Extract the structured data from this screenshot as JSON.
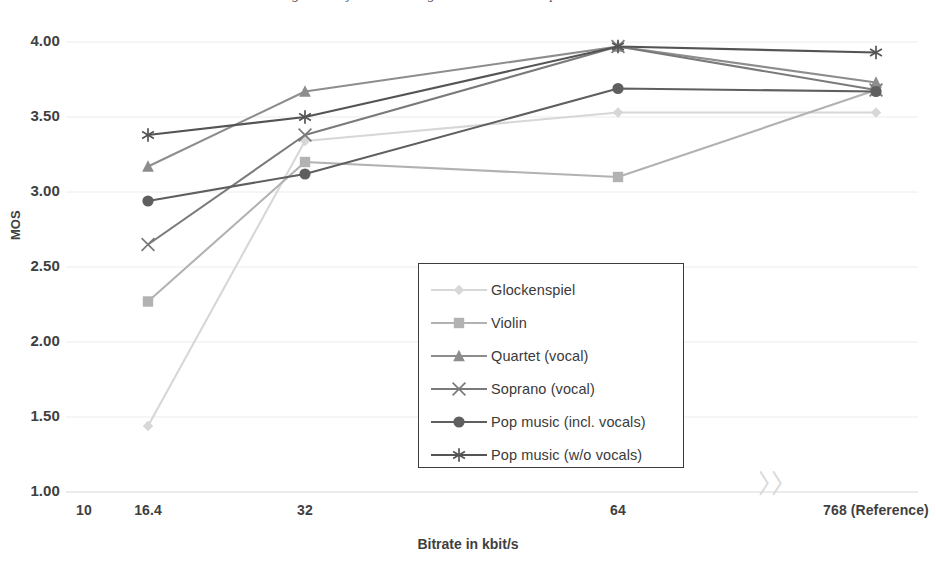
{
  "caption_clipped": "Figure: Subjective listening test results — MOS per item vs. bitrate",
  "axes": {
    "y_title": "MOS",
    "x_title": "Bitrate in kbit/s",
    "y_ticks": [
      "4.00",
      "3.50",
      "3.00",
      "2.50",
      "2.00",
      "1.50",
      "1.00"
    ],
    "x_ticks": [
      "10",
      "16.4",
      "32",
      "64",
      "768 (Reference)"
    ],
    "axis_break_symbol": "≈"
  },
  "legend": {
    "position": "center",
    "entries": [
      {
        "label": "Glockenspiel",
        "marker": "diamond-marker",
        "color": "#d7d7d7"
      },
      {
        "label": "Violin",
        "marker": "square-marker",
        "color": "#b2b2b2"
      },
      {
        "label": "Quartet (vocal)",
        "marker": "triangle-marker",
        "color": "#8d8d8d"
      },
      {
        "label": "Soprano (vocal)",
        "marker": "cross-marker",
        "color": "#7a7a7a"
      },
      {
        "label": "Pop music (incl. vocals)",
        "marker": "circle-marker",
        "color": "#5f5f5f"
      },
      {
        "label": "Pop music (w/o vocals)",
        "marker": "asterisk-marker",
        "color": "#545454"
      }
    ]
  },
  "chart_data": {
    "type": "line",
    "title": "",
    "xlabel": "Bitrate in kbit/s",
    "ylabel": "MOS",
    "categories": [
      "16.4",
      "32",
      "64",
      "768 (Reference)"
    ],
    "x_tick_labels": [
      "10",
      "16.4",
      "32",
      "64",
      "768 (Reference)"
    ],
    "ylim": [
      1.0,
      4.0
    ],
    "ytick_values": [
      1.0,
      1.5,
      2.0,
      2.5,
      3.0,
      3.5,
      4.0
    ],
    "grid": "horizontal",
    "legend_position": "center",
    "axis_break_before_last_category": true,
    "series": [
      {
        "name": "Glockenspiel",
        "marker": "diamond",
        "color": "#d7d7d7",
        "values": [
          1.44,
          3.34,
          3.53,
          3.53
        ]
      },
      {
        "name": "Violin",
        "marker": "square",
        "color": "#b2b2b2",
        "values": [
          2.27,
          3.2,
          3.1,
          3.68
        ]
      },
      {
        "name": "Quartet (vocal)",
        "marker": "triangle",
        "color": "#8d8d8d",
        "values": [
          3.17,
          3.67,
          3.97,
          3.73
        ]
      },
      {
        "name": "Soprano (vocal)",
        "marker": "cross",
        "color": "#7a7a7a",
        "values": [
          2.65,
          3.38,
          3.97,
          3.68
        ]
      },
      {
        "name": "Pop music (incl. vocals)",
        "marker": "circle",
        "color": "#5f5f5f",
        "values": [
          2.94,
          3.12,
          3.69,
          3.67
        ]
      },
      {
        "name": "Pop music (w/o vocals)",
        "marker": "asterisk",
        "color": "#545454",
        "values": [
          3.38,
          3.5,
          3.97,
          3.93
        ]
      }
    ]
  }
}
